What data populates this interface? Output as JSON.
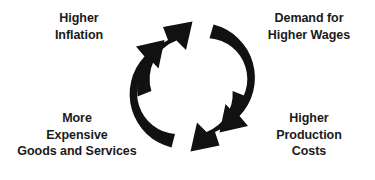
{
  "diagram": {
    "type": "cycle",
    "direction": "clockwise",
    "background_color": "#ffffff",
    "text_color": "#1a1a1a",
    "arrow_color": "#111111",
    "nodes": [
      {
        "id": "higher-inflation",
        "position": "top-left",
        "label": "Higher\nInflation"
      },
      {
        "id": "demand-higher-wages",
        "position": "top-right",
        "label": "Demand for\nHigher Wages"
      },
      {
        "id": "higher-production-costs",
        "position": "bottom-right",
        "label": "Higher\nProduction\nCosts"
      },
      {
        "id": "more-expensive-goods",
        "position": "bottom-left",
        "label": "More\nExpensive\nGoods and Services"
      }
    ],
    "arrows": [
      {
        "id": "arrow-top-left",
        "name": "arrow-to-demand-higher-wages",
        "from": "higher-inflation",
        "to": "demand-higher-wages",
        "quadrant": "upper-left"
      },
      {
        "id": "arrow-top-right",
        "name": "arrow-to-higher-production-costs",
        "from": "demand-higher-wages",
        "to": "higher-production-costs",
        "quadrant": "upper-right"
      },
      {
        "id": "arrow-bottom-right",
        "name": "arrow-to-more-expensive-goods",
        "from": "higher-production-costs",
        "to": "more-expensive-goods",
        "quadrant": "lower-right"
      },
      {
        "id": "arrow-bottom-left",
        "name": "arrow-to-higher-inflation",
        "from": "more-expensive-goods",
        "to": "higher-inflation",
        "quadrant": "lower-left"
      }
    ]
  }
}
